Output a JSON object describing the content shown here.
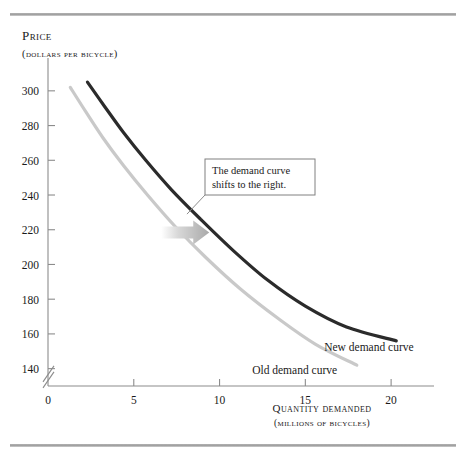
{
  "figure": {
    "background": "#ffffff",
    "rule_color": "#a8a8a8"
  },
  "chart_data": {
    "type": "line",
    "title": "",
    "ylabel_line1": "Price",
    "ylabel_line2": "(dollars per bicycle)",
    "xlabel_line1": "Quantity demanded",
    "xlabel_line2": "(millions of bicycles)",
    "xlabel": "Quantity demanded (millions of bicycles)",
    "ylabel": "Price (dollars per bicycle)",
    "xlim": [
      0,
      22.5
    ],
    "ylim": [
      130,
      312
    ],
    "y_axis_break": true,
    "grid": false,
    "legend_position": "inline-labels",
    "xticks": [
      0,
      5,
      10,
      15,
      20
    ],
    "xticklabels": [
      "0",
      "5",
      "10",
      "15",
      "20"
    ],
    "yticks": [
      140,
      160,
      180,
      200,
      220,
      240,
      260,
      280,
      300
    ],
    "yticklabels": [
      "140",
      "160",
      "180",
      "200",
      "220",
      "240",
      "260",
      "280",
      "300"
    ],
    "series": [
      {
        "name": "Old demand curve",
        "label": "Old demand curve",
        "color": "#c9c9c9",
        "width": 3.2,
        "label_pos": {
          "x": 11.9,
          "y": 137
        },
        "x": [
          1.3,
          2.2,
          3.2,
          4.4,
          5.8,
          7.4,
          9.2,
          11.2,
          13.4,
          15.6,
          18.0
        ],
        "y": [
          302,
          288,
          273,
          257,
          240,
          222,
          204,
          186,
          169,
          154,
          142
        ]
      },
      {
        "name": "New demand curve",
        "label": "New demand curve",
        "color": "#2b2b2b",
        "width": 3.2,
        "label_pos": {
          "x": 16.1,
          "y": 150
        },
        "x": [
          2.3,
          3.3,
          4.4,
          5.7,
          7.2,
          8.9,
          10.8,
          12.8,
          15.0,
          17.4,
          20.3
        ],
        "y": [
          305,
          291,
          276,
          260,
          243,
          226,
          208,
          191,
          176,
          164,
          156
        ]
      }
    ],
    "annotations": [
      {
        "name": "callout-box",
        "text_line1": "The demand curve",
        "text_line2": "shifts to the right.",
        "text": "The demand curve shifts to the right.",
        "box_color": "#808080",
        "leader_from": {
          "x": 8.1,
          "y": 229
        },
        "leader_to": {
          "x": 9.6,
          "y": 256
        }
      },
      {
        "name": "shift-arrow",
        "text": "",
        "direction": "right",
        "color": "#bdbdbd",
        "x": 8.0,
        "y": 219
      }
    ]
  }
}
